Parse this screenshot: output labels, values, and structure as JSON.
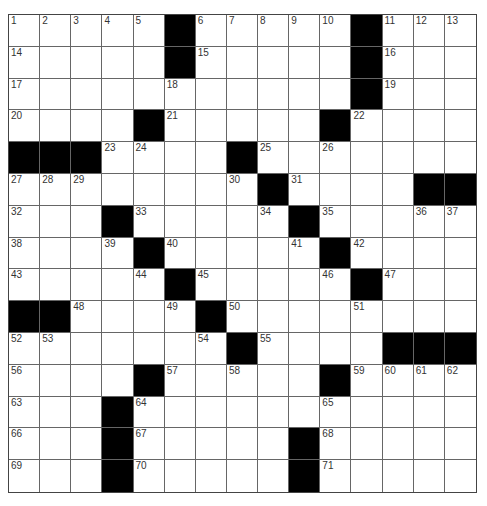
{
  "puzzle": {
    "rows": 15,
    "cols": 15,
    "colors": {
      "block": "#000000",
      "cell": "#ffffff",
      "line": "#666666",
      "number": "#333333"
    },
    "grid": [
      [
        "1",
        "2",
        "3",
        "4",
        "5",
        "#",
        "6",
        "7",
        "8",
        "9",
        "10",
        "#",
        "11",
        "12",
        "13"
      ],
      [
        "14",
        "",
        "",
        "",
        "",
        "#",
        "15",
        "",
        "",
        "",
        "",
        "#",
        "16",
        "",
        ""
      ],
      [
        "17",
        "",
        "",
        "",
        "",
        "18",
        "",
        "",
        "",
        "",
        "",
        "#",
        "19",
        "",
        ""
      ],
      [
        "20",
        "",
        "",
        "",
        "#",
        "21",
        "",
        "",
        "",
        "",
        "#",
        "22",
        "",
        "",
        ""
      ],
      [
        "#",
        "#",
        "#",
        "23",
        "24",
        "",
        "",
        "#",
        "25",
        "",
        "26",
        "",
        "",
        "",
        ""
      ],
      [
        "27",
        "28",
        "29",
        "",
        "",
        "",
        "",
        "30",
        "#",
        "31",
        "",
        "",
        "",
        "#",
        "#"
      ],
      [
        "32",
        "",
        "",
        "#",
        "33",
        "",
        "",
        "",
        "34",
        "#",
        "35",
        "",
        "",
        "36",
        "37"
      ],
      [
        "38",
        "",
        "",
        "39",
        "#",
        "40",
        "",
        "",
        "",
        "41",
        "#",
        "42",
        "",
        "",
        ""
      ],
      [
        "43",
        "",
        "",
        "",
        "44",
        "#",
        "45",
        "",
        "",
        "",
        "46",
        "#",
        "47",
        "",
        ""
      ],
      [
        "#",
        "#",
        "48",
        "",
        "",
        "49",
        "#",
        "50",
        "",
        "",
        "",
        "51",
        "",
        "",
        ""
      ],
      [
        "52",
        "53",
        "",
        "",
        "",
        "",
        "54",
        "#",
        "55",
        "",
        "",
        "",
        "#",
        "#",
        "#"
      ],
      [
        "56",
        "",
        "",
        "",
        "#",
        "57",
        "",
        "58",
        "",
        "",
        "#",
        "59",
        "60",
        "61",
        "62"
      ],
      [
        "63",
        "",
        "",
        "#",
        "64",
        "",
        "",
        "",
        "",
        "",
        "65",
        "",
        "",
        "",
        ""
      ],
      [
        "66",
        "",
        "",
        "#",
        "67",
        "",
        "",
        "",
        "",
        "#",
        "68",
        "",
        "",
        "",
        ""
      ],
      [
        "69",
        "",
        "",
        "#",
        "70",
        "",
        "",
        "",
        "",
        "#",
        "71",
        "",
        "",
        "",
        ""
      ]
    ]
  }
}
